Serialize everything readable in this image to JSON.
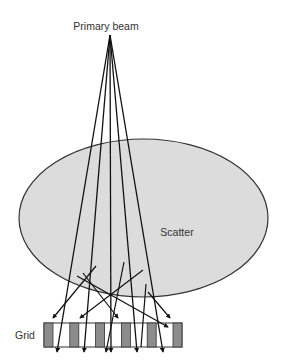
{
  "diagram": {
    "title_label": "Primary beam",
    "object_label": "Scatter",
    "grid_label": "Grid",
    "colors": {
      "object_fill": "#dcdcdc",
      "object_stroke": "#333333",
      "grid_bar_fill": "#8c8c8c",
      "grid_frame": "#333333",
      "ray": "#111111",
      "text": "#333333"
    },
    "source_point": {
      "x": 110,
      "y": 35
    },
    "object_ellipse": {
      "cx": 143.5,
      "cy": 218,
      "rx": 124.5,
      "ry": 79
    },
    "grid": {
      "x": 44,
      "y": 323,
      "width": 138,
      "height": 24,
      "bar_count": 6,
      "bar_width": 9
    },
    "primary_rays": [
      {
        "x_end": 57,
        "y_end": 352,
        "transmitted": true
      },
      {
        "x_end": 84,
        "y_end": 352,
        "transmitted": true
      },
      {
        "x_end": 111,
        "y_end": 352,
        "transmitted": true
      },
      {
        "x_end": 137,
        "y_end": 352,
        "transmitted": true
      },
      {
        "x_end": 163,
        "y_end": 352,
        "transmitted": true
      }
    ],
    "scatter_rays": [
      {
        "x1": 96,
        "y1": 266,
        "x2": 53,
        "y2": 318,
        "outcome": "absorbed"
      },
      {
        "x1": 83,
        "y1": 273,
        "x2": 118,
        "y2": 318,
        "outcome": "absorbed"
      },
      {
        "x1": 143,
        "y1": 270,
        "x2": 80,
        "y2": 318,
        "outcome": "absorbed"
      },
      {
        "x1": 124,
        "y1": 262,
        "x2": 106,
        "y2": 352,
        "outcome": "transmitted"
      },
      {
        "x1": 77,
        "y1": 276,
        "x2": 168,
        "y2": 327,
        "outcome": "absorbed"
      },
      {
        "x1": 146,
        "y1": 284,
        "x2": 141,
        "y2": 347,
        "outcome": "absorbed"
      },
      {
        "x1": 148,
        "y1": 292,
        "x2": 170,
        "y2": 318,
        "outcome": "absorbed"
      }
    ]
  }
}
